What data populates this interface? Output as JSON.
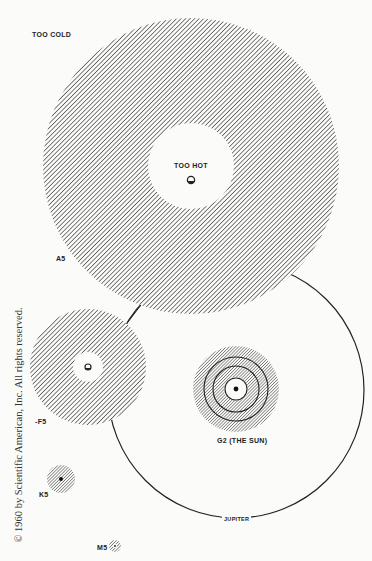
{
  "labels": {
    "too_cold": "TOO COLD",
    "too_hot": "TOO HOT",
    "a5": "A5",
    "f5": "-F5",
    "g2": "G2   (THE SUN)",
    "k5": "K5",
    "m5": "M5",
    "jupiter": "JUPITER"
  },
  "copyright": "© 1960 by Scientific American, Inc. All rights reserved.",
  "colors": {
    "background": "#fbfbf9",
    "ink": "#222222",
    "hatch": "#3a3a3a"
  },
  "stars": [
    {
      "name": "A5",
      "cx": 191,
      "cy": 166,
      "outer_r": 148,
      "inner_r": 43
    },
    {
      "name": "F5",
      "cx": 88,
      "cy": 367,
      "outer_r": 58,
      "inner_r": 15
    },
    {
      "name": "G2",
      "cx": 236,
      "cy": 389,
      "outer_r": 43,
      "inner_r": 12,
      "rings": [
        23,
        32
      ]
    },
    {
      "name": "K5",
      "cx": 61,
      "cy": 479,
      "outer_r": 14,
      "inner_r": 0
    },
    {
      "name": "M5",
      "cx": 115,
      "cy": 546,
      "outer_r": 6,
      "inner_r": 0
    }
  ],
  "jupiter_orbit": {
    "cx": 236,
    "cy": 390,
    "r": 128
  }
}
